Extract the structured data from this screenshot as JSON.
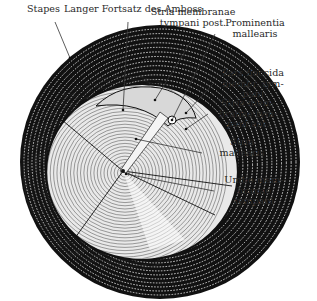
{
  "figure": {
    "colors": {
      "ink": "#111111",
      "paper": "#ffffff",
      "label_text": "#2a2a2a"
    },
    "center": {
      "umbo": [
        123,
        171
      ]
    },
    "labels": [
      {
        "id": "stapes",
        "lines": [
          "Stapes"
        ],
        "x": 27,
        "y": 12,
        "align": "left",
        "target": [
          70,
          58
        ]
      },
      {
        "id": "langer-fortsatz",
        "lines": [
          "Langer Fortsatz des Amboss"
        ],
        "x": 64,
        "y": 12,
        "align": "left",
        "target": [
          123,
          110
        ]
      },
      {
        "id": "stria-post",
        "lines": [
          "Stria membranae",
          "tympani post."
        ],
        "x": 193,
        "y": 15,
        "align": "center",
        "target": [
          155,
          100
        ]
      },
      {
        "id": "prominentia",
        "lines": [
          "Prominentia",
          "mallearis"
        ],
        "x": 255,
        "y": 26,
        "align": "center",
        "target": [
          172,
          120
        ]
      },
      {
        "id": "pars-flaccida",
        "lines": [
          "Pars flaccida",
          "membr. tym-",
          "pani"
        ],
        "x": 253,
        "y": 76,
        "align": "center",
        "target": [
          186,
          113
        ]
      },
      {
        "id": "stria-ant",
        "lines": [
          "Stria mem-",
          "branae tym-",
          "pani ant."
        ],
        "x": 248,
        "y": 106,
        "align": "center",
        "target": [
          186,
          129
        ]
      },
      {
        "id": "stria-mallearis",
        "lines": [
          "Stria",
          "mallearis"
        ],
        "x": 242,
        "y": 145,
        "align": "center",
        "target": [
          136,
          139
        ]
      },
      {
        "id": "umbo",
        "lines": [
          "Umbo mem-",
          "branae",
          "tympani"
        ],
        "x": 254,
        "y": 183,
        "align": "center",
        "target": [
          126,
          174
        ]
      }
    ]
  }
}
